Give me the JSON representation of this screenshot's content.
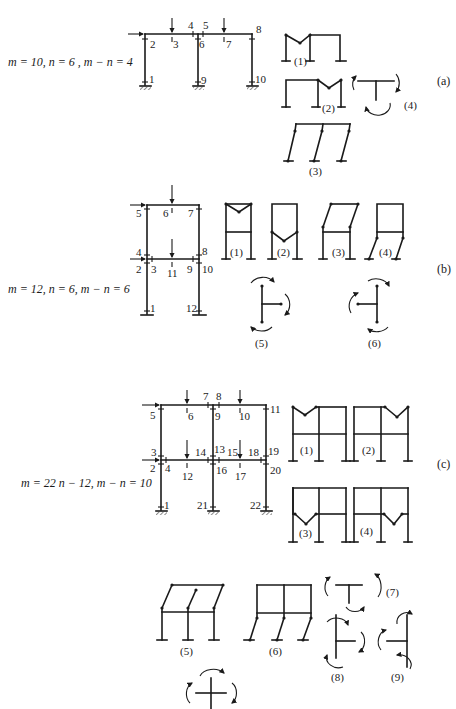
{
  "figure": {
    "parts": [
      {
        "id": "a",
        "tag": "(a)",
        "equation": "m = 10, n = 6 , m − n = 4",
        "node_labels": [
          "1",
          "2",
          "3",
          "4",
          "5",
          "6",
          "7",
          "8",
          "9",
          "10"
        ],
        "mechanism_labels": [
          "(1)",
          "(2)",
          "(3)",
          "(4)"
        ]
      },
      {
        "id": "b",
        "tag": "(b)",
        "equation": "m = 12, n = 6, m − n = 6",
        "node_labels": [
          "1",
          "2",
          "3",
          "4",
          "5",
          "6",
          "7",
          "8",
          "9",
          "10",
          "11",
          "12"
        ],
        "mechanism_labels": [
          "(1)",
          "(2)",
          "(3)",
          "(4)",
          "(5)",
          "(6)"
        ]
      },
      {
        "id": "c",
        "tag": "(c)",
        "equation": "m = 22  n − 12, m − n = 10",
        "node_labels": [
          "1",
          "2",
          "3",
          "4",
          "5",
          "6",
          "7",
          "8",
          "9",
          "10",
          "11",
          "12",
          "13",
          "14",
          "15",
          "16",
          "17",
          "18",
          "19",
          "20",
          "21",
          "22"
        ],
        "mechanism_labels": [
          "(1)",
          "(2)",
          "(3)",
          "(4)",
          "(5)",
          "(6)",
          "(7)",
          "(8)",
          "(9)"
        ]
      }
    ]
  }
}
